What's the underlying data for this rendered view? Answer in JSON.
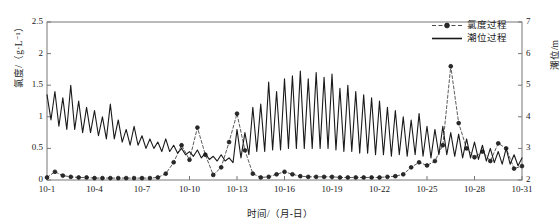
{
  "chart_data": {
    "type": "line",
    "title": "",
    "xlabel": "时间/（月-日）",
    "ylabel_left": "氯度/（g·L⁻¹）",
    "ylabel_right": "潮位/m",
    "grid": false,
    "legend_position": "top-right",
    "x_ticks": [
      "10-1",
      "10-4",
      "10-7",
      "10-10",
      "10-13",
      "10-16",
      "10-19",
      "10-22",
      "10-25",
      "10-28",
      "10-31"
    ],
    "x_range_days": [
      1,
      31
    ],
    "y_left_ticks": [
      "0",
      "0.5",
      "1",
      "1.5",
      "2",
      "2.5"
    ],
    "y_left_lim": [
      0,
      2.5
    ],
    "y_right_ticks": [
      "2",
      "3",
      "4",
      "5",
      "6",
      "7"
    ],
    "y_right_lim": [
      2,
      7
    ],
    "series": [
      {
        "name": "氯度过程",
        "axis": "left",
        "style": "dashed-marker",
        "color": "#4a4a4a",
        "marker": "circle",
        "x": [
          1,
          1.5,
          2,
          2.5,
          3,
          3.5,
          4,
          4.5,
          5,
          5.5,
          6,
          6.5,
          7,
          7.5,
          8,
          8.5,
          9,
          9.5,
          10,
          10.5,
          11,
          11.5,
          12,
          12.5,
          13,
          13.5,
          14,
          14.5,
          15,
          15.5,
          16,
          16.5,
          17,
          17.5,
          18,
          18.5,
          19,
          19.5,
          20,
          20.5,
          21,
          21.5,
          22,
          22.5,
          23,
          23.5,
          24,
          24.5,
          25,
          25.5,
          26,
          26.5,
          27,
          27.5,
          28,
          28.5,
          29,
          29.5,
          30,
          30.5,
          31
        ],
        "values": [
          0.04,
          0.13,
          0.07,
          0.05,
          0.04,
          0.04,
          0.03,
          0.03,
          0.03,
          0.03,
          0.03,
          0.03,
          0.03,
          0.03,
          0.04,
          0.1,
          0.28,
          0.55,
          0.32,
          0.83,
          0.4,
          0.08,
          0.2,
          0.6,
          1.05,
          0.47,
          0.1,
          0.04,
          0.05,
          0.09,
          0.13,
          0.09,
          0.06,
          0.05,
          0.05,
          0.05,
          0.05,
          0.04,
          0.04,
          0.04,
          0.04,
          0.04,
          0.04,
          0.05,
          0.06,
          0.09,
          0.2,
          0.28,
          0.23,
          0.3,
          0.55,
          1.8,
          0.9,
          0.5,
          0.36,
          0.45,
          0.3,
          0.58,
          0.5,
          0.18,
          0.22
        ]
      },
      {
        "name": "潮位过程",
        "axis": "right",
        "style": "solid",
        "color": "#1a1a1a",
        "x": [
          1,
          1.25,
          1.5,
          1.75,
          2,
          2.25,
          2.5,
          2.75,
          3,
          3.25,
          3.5,
          3.75,
          4,
          4.25,
          4.5,
          4.75,
          5,
          5.25,
          5.5,
          5.75,
          6,
          6.25,
          6.5,
          6.75,
          7,
          7.25,
          7.5,
          7.75,
          8,
          8.25,
          8.5,
          8.75,
          9,
          9.25,
          9.5,
          9.75,
          10,
          10.25,
          10.5,
          10.75,
          11,
          11.25,
          11.5,
          11.75,
          12,
          12.25,
          12.5,
          12.75,
          13,
          13.25,
          13.5,
          13.75,
          14,
          14.25,
          14.5,
          14.75,
          15,
          15.25,
          15.5,
          15.75,
          16,
          16.25,
          16.5,
          16.75,
          17,
          17.25,
          17.5,
          17.75,
          18,
          18.25,
          18.5,
          18.75,
          19,
          19.25,
          19.5,
          19.75,
          20,
          20.25,
          20.5,
          20.75,
          21,
          21.25,
          21.5,
          21.75,
          22,
          22.25,
          22.5,
          22.75,
          23,
          23.25,
          23.5,
          23.75,
          24,
          24.25,
          24.5,
          24.75,
          25,
          25.25,
          25.5,
          25.75,
          26,
          26.25,
          26.5,
          26.75,
          27,
          27.25,
          27.5,
          27.75,
          28,
          28.25,
          28.5,
          28.75,
          29,
          29.25,
          29.5,
          29.75,
          30,
          30.25,
          30.5,
          30.75,
          31
        ],
        "values": [
          4.7,
          3.9,
          4.8,
          3.7,
          4.6,
          3.6,
          5.0,
          3.6,
          4.5,
          3.5,
          4.3,
          3.5,
          4.2,
          3.4,
          4.0,
          3.3,
          4.4,
          3.3,
          3.9,
          3.2,
          3.6,
          3.1,
          3.7,
          3.1,
          3.4,
          3.0,
          3.3,
          3.0,
          3.2,
          2.9,
          3.3,
          2.9,
          3.1,
          2.85,
          3.0,
          2.8,
          2.9,
          2.75,
          2.95,
          2.7,
          2.85,
          2.65,
          2.75,
          2.6,
          2.8,
          2.6,
          2.7,
          2.55,
          3.6,
          2.7,
          3.5,
          2.8,
          4.3,
          2.9,
          4.4,
          2.9,
          5.1,
          2.95,
          4.8,
          2.95,
          5.2,
          3.0,
          5.3,
          3.0,
          5.45,
          3.0,
          5.2,
          3.0,
          5.4,
          3.0,
          5.25,
          3.0,
          5.35,
          2.95,
          4.9,
          2.9,
          5.0,
          2.9,
          4.8,
          2.85,
          4.7,
          2.85,
          4.6,
          2.8,
          4.5,
          2.8,
          4.3,
          2.75,
          4.2,
          2.8,
          4.0,
          2.75,
          3.9,
          2.8,
          4.1,
          2.75,
          3.7,
          2.7,
          3.6,
          2.8,
          3.7,
          2.8,
          3.5,
          2.75,
          3.45,
          2.7,
          3.3,
          2.7,
          3.2,
          2.65,
          3.1,
          2.6,
          3.0,
          2.55,
          2.9,
          2.5,
          3.0,
          2.5,
          2.8,
          2.45,
          2.7
        ]
      }
    ]
  },
  "legend": {
    "items": [
      {
        "label": "氯度过程",
        "key": "dashed-marker"
      },
      {
        "label": "潮位过程",
        "key": "solid"
      }
    ]
  },
  "colors": {
    "salinity": "#4a4a4a",
    "tide": "#1a1a1a",
    "axis": "#777777",
    "text": "#1a1a1a"
  }
}
